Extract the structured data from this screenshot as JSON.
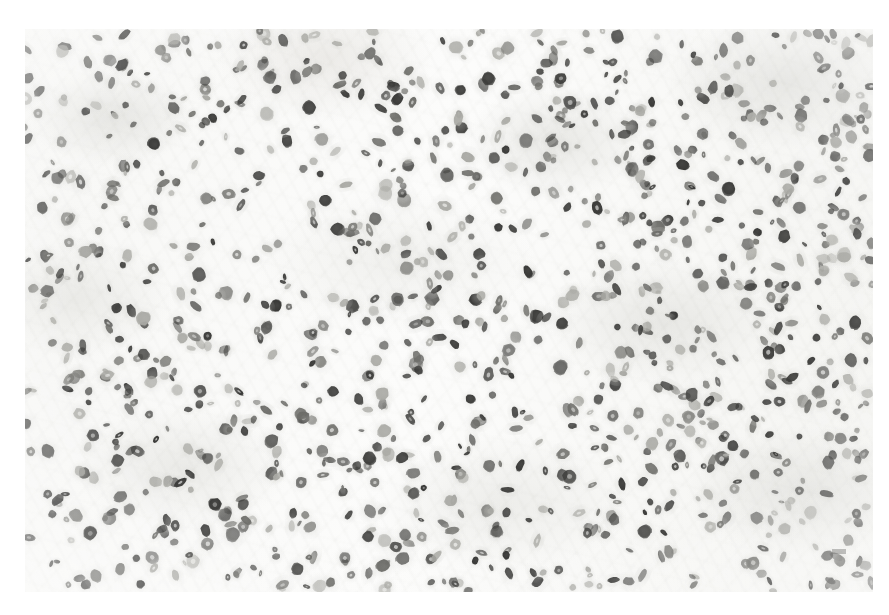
{
  "figure": {
    "caption": "",
    "stain": "immunohistochemistry, nuclear chromogen with pale counterstain",
    "tissue": "hypercellular glial neoplasm",
    "magnification": "high power field",
    "canvas": {
      "width": 889,
      "height": 615
    },
    "field": {
      "x": 25,
      "y": 29,
      "width": 848,
      "height": 563
    },
    "background_color": "#ffffff",
    "matrix_color": "#f4f4f1",
    "nucleus_dark_color": "#3a3a38",
    "nucleus_mid_color": "#6e6e6a",
    "nucleus_pale_color": "#a9a9a4",
    "border_color": "#ffffff"
  },
  "corner_mark": {
    "label": "faint-artifact-mark",
    "x": 832,
    "y": 549,
    "width": 14,
    "height": 5
  },
  "chart_data": {
    "type": "scatter",
    "xlabel": "horizontal position (px)",
    "ylabel": "vertical position (px)",
    "xlim": [
      0,
      848
    ],
    "ylim": [
      0,
      563
    ],
    "grid": false,
    "legend": "none",
    "series": [
      {
        "name": "darkly stained nuclei",
        "count": 640,
        "color": "#3a3a38"
      },
      {
        "name": "moderately stained nuclei",
        "count": 300,
        "color": "#6e6e6a"
      },
      {
        "name": "faintly stained nuclei",
        "count": 260,
        "color": "#a9a9a4"
      }
    ],
    "density_regions": [
      {
        "region": "upper-left",
        "relative_density": 0.8
      },
      {
        "region": "upper-middle",
        "relative_density": 0.95
      },
      {
        "region": "upper-right",
        "relative_density": 1.2
      },
      {
        "region": "middle-left",
        "relative_density": 0.85
      },
      {
        "region": "center",
        "relative_density": 0.9
      },
      {
        "region": "middle-right",
        "relative_density": 1.15
      },
      {
        "region": "lower-left",
        "relative_density": 0.95
      },
      {
        "region": "lower-middle",
        "relative_density": 1.0
      },
      {
        "region": "lower-right",
        "relative_density": 1.1
      }
    ],
    "nucleus_size_px": {
      "min": 6,
      "max": 15,
      "mean": 10
    },
    "nucleus_axis_ratio": {
      "min": 1.0,
      "max": 2.4
    },
    "total_nuclei": 1200
  }
}
